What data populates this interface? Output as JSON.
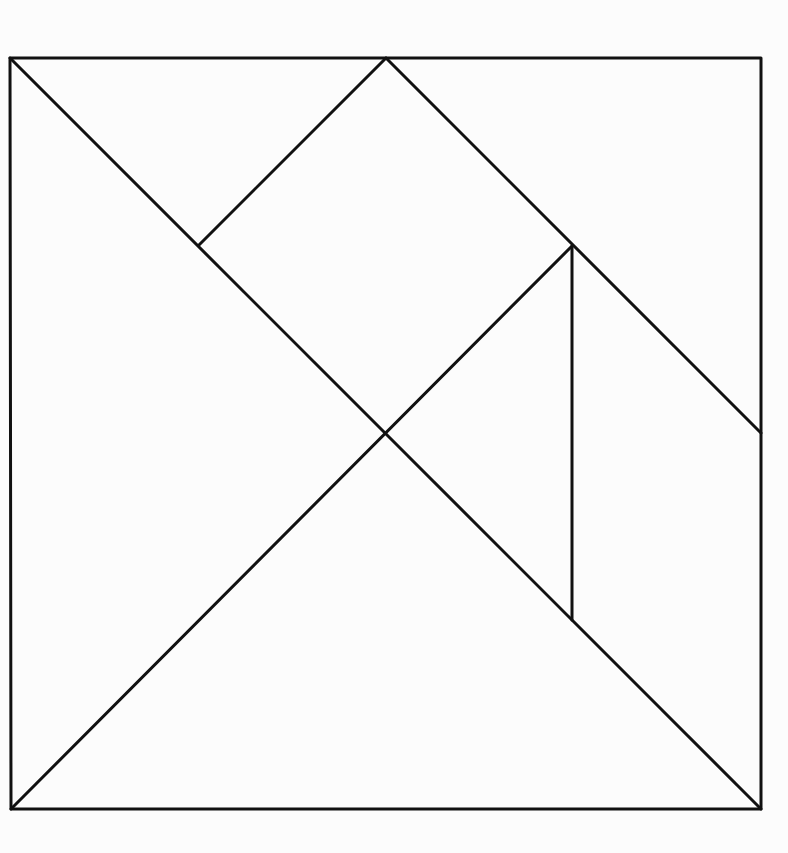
{
  "diagram": {
    "stroke_color": "#111111",
    "background_color": "#fcfcfc",
    "stroke_width": 3,
    "square": {
      "x1": 10,
      "y1": 58,
      "x2": 761,
      "y2": 809
    },
    "vertices": {
      "top_left": [
        10,
        58
      ],
      "top_mid": [
        386,
        58
      ],
      "top_right": [
        761,
        58
      ],
      "right_mid": [
        761,
        433
      ],
      "bottom_right": [
        761,
        809
      ],
      "bottom_left": [
        11,
        809
      ],
      "center": [
        386,
        433
      ],
      "upper_left_inner": [
        199,
        245
      ],
      "upper_right_inner": [
        572,
        246
      ],
      "lower_right_inner": [
        572,
        620
      ]
    },
    "pieces": [
      {
        "id": "large-triangle-left",
        "label": "Large triangle (left)",
        "points": "10,58 386,433 11,809"
      },
      {
        "id": "large-triangle-bottom",
        "label": "Large triangle (bottom)",
        "points": "11,809 386,433 761,809"
      },
      {
        "id": "medium-triangle-top",
        "label": "Medium triangle (top)",
        "points": "10,58 386,58 199,245"
      },
      {
        "id": "square-diamond",
        "label": "Square",
        "points": "199,245 386,58 572,246 386,433"
      },
      {
        "id": "parallelogram-top",
        "label": "Parallelogram (top-right)",
        "points": "386,58 761,58 761,433 572,246"
      },
      {
        "id": "small-triangle-center",
        "label": "Small triangle (center)",
        "points": "386,433 572,246 572,620"
      },
      {
        "id": "quad-right",
        "label": "Right piece",
        "points": "572,246 761,433 761,809 572,620"
      }
    ],
    "edges": [
      {
        "id": "outer-border",
        "points": "10,58 761,58 761,809 11,809 10,58"
      },
      {
        "id": "main-diagonal",
        "points": "10,58 761,809"
      },
      {
        "id": "anti-diagonal-lower",
        "points": "11,809 572,246"
      },
      {
        "id": "top-left-cut",
        "points": "199,245 386,58"
      },
      {
        "id": "top-right-cut",
        "points": "386,58 761,433"
      },
      {
        "id": "vertical-cut",
        "points": "572,246 572,620"
      }
    ]
  }
}
